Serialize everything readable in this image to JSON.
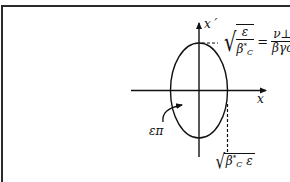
{
  "diagram": {
    "type": "phase-space-ellipse",
    "axes": {
      "horizontal_label": "x",
      "vertical_label": "x ′"
    },
    "ellipse": {
      "area_label": "επ"
    },
    "annotations": {
      "top_formula": {
        "sqrt_numerator": "ε",
        "sqrt_denominator": "β",
        "sqrt_denominator_sub": "C",
        "sqrt_denominator_sup": "*",
        "equals": "=",
        "rhs_numerator": "ν⊥",
        "rhs_denominator": "βγc"
      },
      "bottom_formula": {
        "sqrt_symbol": "√",
        "beta": "β",
        "beta_sub": "C",
        "beta_sup": "*",
        "epsilon": "ε"
      }
    },
    "colors": {
      "stroke": "#111111",
      "background": "#ffffff",
      "frame": "#2a2a2a"
    }
  }
}
